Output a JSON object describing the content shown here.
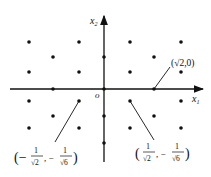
{
  "diagram": {
    "axes": {
      "x_label": "x",
      "x_sub": "1",
      "y_label": "x",
      "y_sub": "2",
      "origin_label": "o"
    },
    "annotations": {
      "point_a": {
        "open": "(",
        "sqrt": "√",
        "rad": "2",
        "rest": ",0)"
      },
      "point_b": {
        "open": "(−",
        "num1": "1",
        "den1": "√2",
        "comma": ", −",
        "num2": "1",
        "den2": "√6",
        "close": ")"
      },
      "point_c": {
        "open": "(",
        "num1": "1",
        "den1": "√2",
        "comma": ", −",
        "num2": "1",
        "den2": "√6",
        "close": ")"
      }
    },
    "colors": {
      "ink": "#111111",
      "background": "#ffffff"
    }
  }
}
